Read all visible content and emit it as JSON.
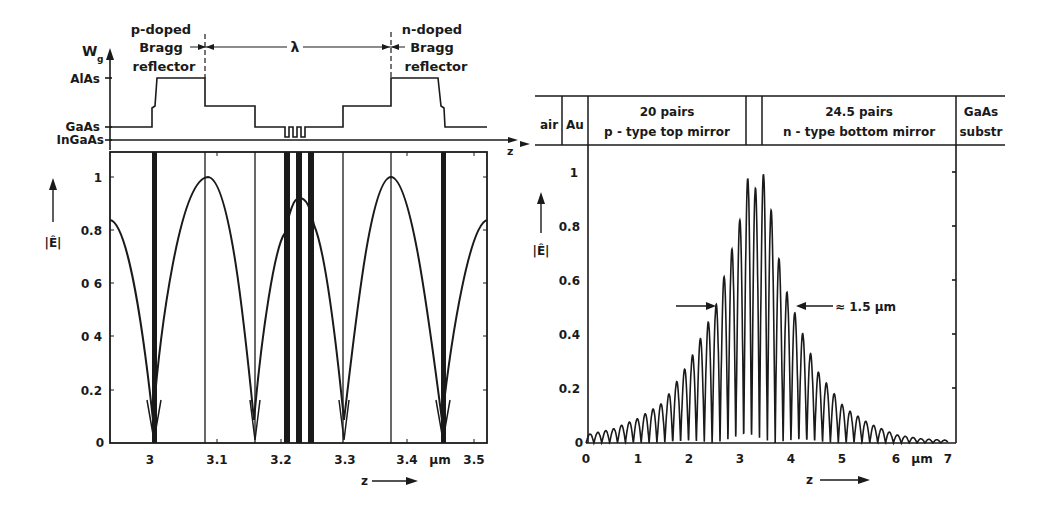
{
  "chart_data": [
    {
      "type": "line",
      "title": "",
      "panel": "left",
      "bandgap_diagram": {
        "ylabel": "Wg",
        "levels": [
          "AlAs",
          "GaAs",
          "InGaAs"
        ],
        "xlabel": "z",
        "annotations": {
          "left_region": "p-doped Bragg reflector",
          "right_region": "n-doped Bragg reflector",
          "cavity": "λ"
        }
      },
      "xlabel": "z",
      "xunit": "μm",
      "ylabel": "|Ê|",
      "xlim": [
        2.94,
        3.52
      ],
      "ylim": [
        0,
        1.1
      ],
      "x_ticks": [
        "3",
        "3.1",
        "3.2",
        "3.3",
        "3.4",
        "3.5"
      ],
      "y_ticks": [
        "0",
        "0.2",
        "0.4",
        "0.6",
        "0.8",
        "1"
      ],
      "grid": false,
      "series": [
        {
          "name": "|Ê| standing wave",
          "x": [
            2.94,
            2.97,
            3.0,
            3.045,
            3.09,
            3.125,
            3.16,
            3.19,
            3.21,
            3.225,
            3.24,
            3.26,
            3.3,
            3.335,
            3.37,
            3.41,
            3.45,
            3.49,
            3.52
          ],
          "y": [
            0.84,
            0.6,
            0.05,
            0.6,
            1.0,
            0.65,
            0.05,
            0.55,
            0.85,
            0.92,
            0.88,
            0.75,
            0.05,
            0.6,
            1.0,
            0.62,
            0.05,
            0.6,
            0.84
          ]
        }
      ],
      "layer_boundaries_um": [
        3.0,
        3.09,
        3.16,
        3.21,
        3.225,
        3.245,
        3.3,
        3.37,
        3.45
      ]
    },
    {
      "type": "line",
      "panel": "right",
      "header_regions": [
        "air",
        "Au",
        "20 pairs p - type top mirror",
        "",
        "24.5 pairs n - type bottom mirror",
        "GaAs substr"
      ],
      "xlabel": "z",
      "xunit": "μm",
      "ylabel": "|Ê|",
      "xlim": [
        0,
        7
      ],
      "ylim": [
        0,
        1.05
      ],
      "x_ticks": [
        "0",
        "1",
        "2",
        "3",
        "4",
        "5",
        "6",
        "7"
      ],
      "y_ticks": [
        "0",
        "0.2",
        "0.4",
        "0.6",
        "0.8",
        "1"
      ],
      "grid": false,
      "annotation": "≈ 1.5 μm",
      "annotation_y": 0.5,
      "series": [
        {
          "name": "|Ê| envelope peaks",
          "x": [
            0.0,
            0.5,
            1.0,
            1.5,
            2.0,
            2.3,
            2.5,
            2.8,
            3.0,
            3.15,
            3.3,
            3.45,
            3.6,
            3.8,
            4.0,
            4.3,
            4.5,
            5.0,
            5.5,
            6.0,
            6.5,
            7.0
          ],
          "y": [
            0.03,
            0.05,
            0.09,
            0.15,
            0.3,
            0.42,
            0.5,
            0.7,
            0.84,
            1.0,
            0.93,
            1.0,
            0.84,
            0.6,
            0.5,
            0.35,
            0.26,
            0.13,
            0.07,
            0.03,
            0.015,
            0.01
          ]
        }
      ]
    }
  ],
  "left": {
    "top_labels": {
      "wg": "W",
      "wg_sub": "g",
      "alas": "AlAs",
      "gaas": "GaAs",
      "ingaas": "InGaAs",
      "p_line1": "p-doped",
      "p_line2": "Bragg",
      "p_line3": "reflector",
      "n_line1": "n-doped",
      "n_line2": "Bragg",
      "n_line3": "reflector",
      "lambda": "λ",
      "z": "z"
    },
    "y_axis_label": "|Ê|",
    "y_ticks": [
      "1",
      "0.8",
      "0 6",
      "0 4",
      "0.2",
      "0"
    ],
    "x_ticks": [
      "3",
      "3.1",
      "3.2",
      "3.3",
      "3.4",
      "3.5"
    ],
    "x_unit": "μm",
    "x_label": "z"
  },
  "right": {
    "header": {
      "air": "air",
      "au": "Au",
      "top_mirror_line1": "20 pairs",
      "top_mirror_line2": "p - type top mirror",
      "bottom_mirror_line1": "24.5 pairs",
      "bottom_mirror_line2": "n - type bottom mirror",
      "substrate_line1": "GaAs",
      "substrate_line2": "substr"
    },
    "y_axis_label": "|Ê|",
    "y_ticks": [
      "1",
      "0.8",
      "0.6",
      "0.4",
      "0.2",
      "0"
    ],
    "x_ticks": [
      "0",
      "1",
      "2",
      "3",
      "4",
      "5",
      "6",
      "7"
    ],
    "x_unit": "μm",
    "x_label": "z",
    "annotation": "≈ 1.5 μm"
  }
}
